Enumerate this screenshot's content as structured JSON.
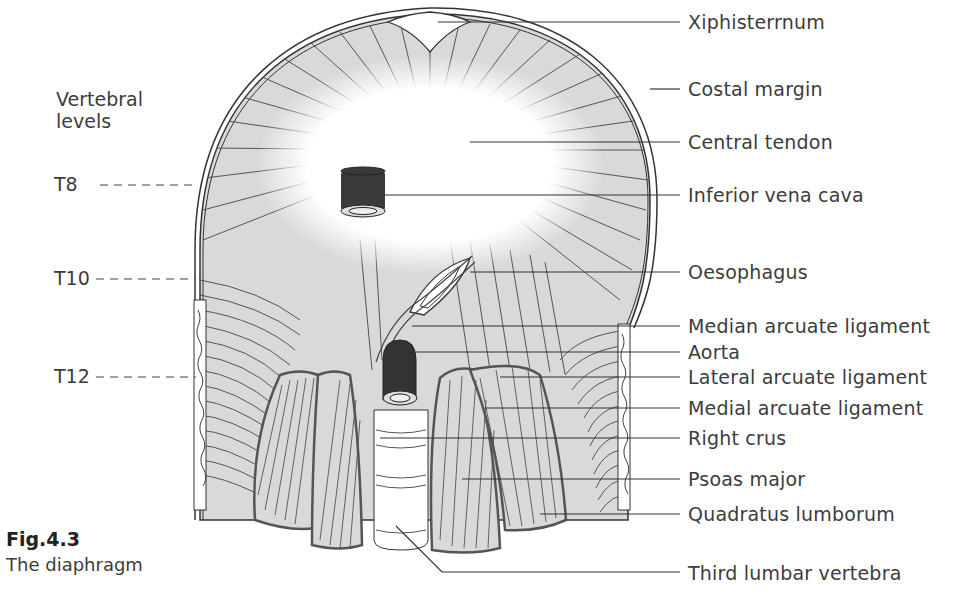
{
  "figure": {
    "number": "Fig.4.3",
    "caption": "The diaphragm"
  },
  "vertebral_levels": {
    "heading_line1": "Vertebral",
    "heading_line2": "levels",
    "levels": [
      {
        "label": "T8",
        "y": 185
      },
      {
        "label": "T10",
        "y": 279
      },
      {
        "label": "T12",
        "y": 377
      }
    ]
  },
  "labels": [
    {
      "text": "Xiphisterrnum",
      "y": 22
    },
    {
      "text": "Costal margin",
      "y": 89
    },
    {
      "text": "Central tendon",
      "y": 142
    },
    {
      "text": "Inferior vena cava",
      "y": 195
    },
    {
      "text": "Oesophagus",
      "y": 272
    },
    {
      "text": "Median arcuate ligament",
      "y": 326
    },
    {
      "text": "Aorta",
      "y": 352
    },
    {
      "text": "Lateral arcuate ligament",
      "y": 377
    },
    {
      "text": "Medial arcuate ligament",
      "y": 408
    },
    {
      "text": "Right crus",
      "y": 438
    },
    {
      "text": "Psoas major",
      "y": 479
    },
    {
      "text": "Quadratus lumborum",
      "y": 514
    },
    {
      "text": "Third lumbar vertebra",
      "y": 573
    }
  ],
  "colors": {
    "muscle_fill": "#d9d9d9",
    "tendon": "#ffffff",
    "lines": "#444444",
    "vessel_dark": "#3a3a3a"
  }
}
